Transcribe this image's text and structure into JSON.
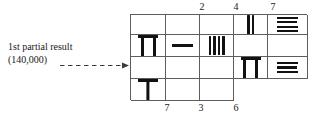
{
  "figure": {
    "caption": {
      "line1": "1st partial result",
      "line2": "(140,000)"
    },
    "arrow": {
      "name": "dashed-arrow",
      "direction": "right",
      "style": "dashed"
    },
    "ink_color": "#111111",
    "grid_line_color": "#5d5d5d"
  },
  "grid": {
    "columns": 5,
    "rows": 3,
    "top_labels": [
      {
        "col": 4,
        "value": "2"
      },
      {
        "col": 5,
        "value": "4"
      },
      {
        "col": 6,
        "value": "7"
      }
    ],
    "bottom_labels": [
      {
        "col": 2,
        "value": "7"
      },
      {
        "col": 3,
        "value": "3"
      },
      {
        "col": 4,
        "value": "6"
      }
    ],
    "cells": [
      [
        {
          "glyph": "empty",
          "value": ""
        },
        {
          "glyph": "empty",
          "value": ""
        },
        {
          "glyph": "empty",
          "value": ""
        },
        {
          "glyph": "vstrokes",
          "value": "2",
          "count": 2
        },
        {
          "glyph": "hbars",
          "value": "4",
          "count": 4
        },
        {
          "glyph": "pi",
          "value": "7"
        }
      ],
      [
        {
          "glyph": "dash",
          "value": "1"
        },
        {
          "glyph": "vstrokes",
          "value": "4",
          "count": 4
        },
        {
          "glyph": "empty",
          "value": ""
        },
        {
          "glyph": "empty",
          "value": ""
        },
        {
          "glyph": "empty",
          "value": ""
        },
        {
          "glyph": "empty",
          "value": ""
        }
      ],
      [
        {
          "glyph": "empty",
          "value": ""
        },
        {
          "glyph": "pi",
          "value": "7"
        },
        {
          "glyph": "hbars",
          "value": "3",
          "count": 3
        },
        {
          "glyph": "tee",
          "value": "6"
        },
        {
          "glyph": "empty",
          "value": ""
        },
        {
          "glyph": "empty",
          "value": ""
        }
      ]
    ]
  }
}
